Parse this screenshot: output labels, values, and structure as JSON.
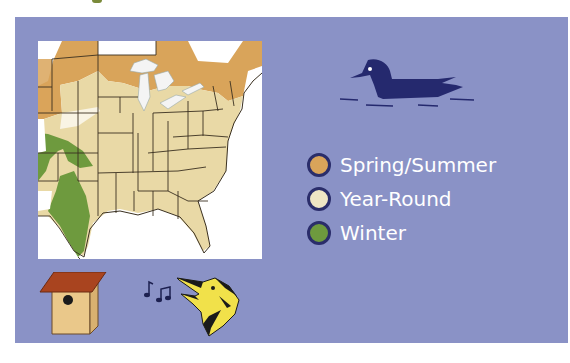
{
  "legend": {
    "items": [
      {
        "label": "Spring/Summer",
        "color": "#d9a45a"
      },
      {
        "label": "Year-Round",
        "color": "#efe6c4"
      },
      {
        "label": "Winter",
        "color": "#6e9a3e"
      }
    ]
  },
  "colors": {
    "panel_background": "#8a92c6",
    "map_background": "#ffffff",
    "state_fill": "#e9d9a6",
    "border_lines": "#3a3020",
    "lakes": "#f2f2f2",
    "duck": "#25296e",
    "swatch_outline": "#2a2d6a"
  },
  "icons": {
    "duck": "wood-duck-icon",
    "birdhouse": "birdhouse-icon",
    "music_notes": "music-notes-icon",
    "singing_bird": "singing-warbler-icon"
  }
}
